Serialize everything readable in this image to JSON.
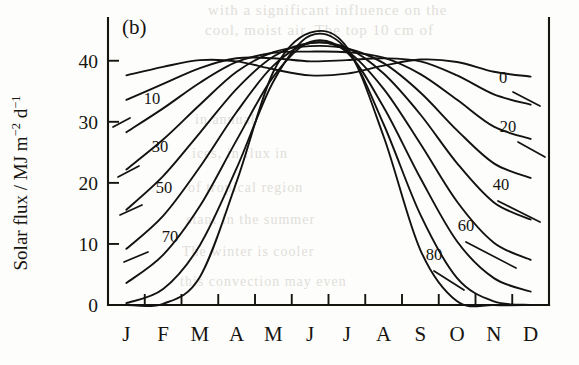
{
  "figure": {
    "panel_label": "(b)",
    "axis_title_y_parts": {
      "main": "Solar flux / MJ m",
      "sup1": "−2",
      "mid": " d",
      "sup2": "−1"
    },
    "y_axis_title_plain": "Solar flux / MJ m-2 d-1"
  },
  "bleed_text": {
    "line1": "with a significant influence on the",
    "line2": "cool, moist air. The top 10 cm of",
    "line3": "in annual",
    "line4": "ices, in flux in",
    "line5": "of tropical region",
    "line6": "stant in the summer",
    "line7": "The winter is cooler",
    "line8": "this convection may even"
  },
  "chart_data": {
    "type": "line",
    "title": "(b)",
    "xlabel": "",
    "ylabel": "Solar flux / MJ m-2 d-1",
    "xlim": [
      0,
      12
    ],
    "ylim": [
      0,
      47
    ],
    "grid": false,
    "legend_position": "inline-curve-labels",
    "yticks": [
      0,
      10,
      20,
      30,
      40
    ],
    "ytick_labels": [
      "0",
      "10",
      "20",
      "30",
      "40"
    ],
    "x": [
      0.5,
      1.5,
      2.5,
      3.5,
      4.5,
      5.5,
      6.5,
      7.5,
      8.5,
      9.5,
      10.5,
      11.5
    ],
    "xtick_labels": [
      "J",
      "F",
      "M",
      "A",
      "M",
      "J",
      "J",
      "A",
      "S",
      "O",
      "N",
      "D"
    ],
    "series": [
      {
        "name": "0",
        "label": "0",
        "label_side": "right",
        "values": [
          37.6,
          39.0,
          40.1,
          39.9,
          38.6,
          37.6,
          37.9,
          39.2,
          40.2,
          39.8,
          38.2,
          37.4
        ]
      },
      {
        "name": "10",
        "label": "10",
        "label_side": "left",
        "values": [
          33.6,
          36.2,
          38.8,
          40.4,
          40.4,
          39.9,
          40.1,
          40.4,
          39.9,
          37.6,
          34.5,
          32.8
        ]
      },
      {
        "name": "20",
        "label": "20",
        "label_side": "right",
        "values": [
          28.3,
          32.2,
          36.4,
          39.8,
          41.3,
          41.5,
          41.4,
          40.5,
          37.8,
          33.6,
          29.2,
          27.2
        ]
      },
      {
        "name": "30",
        "label": "30",
        "label_side": "left",
        "values": [
          22.2,
          27.1,
          32.8,
          38.2,
          41.4,
          42.4,
          42.0,
          39.6,
          34.8,
          28.6,
          23.2,
          20.8
        ]
      },
      {
        "name": "40",
        "label": "40",
        "label_side": "right",
        "values": [
          15.6,
          21.1,
          28.2,
          35.4,
          40.7,
          42.9,
          42.1,
          37.9,
          31.2,
          23.2,
          16.8,
          14.0
        ]
      },
      {
        "name": "50",
        "label": "50",
        "label_side": "left",
        "values": [
          9.2,
          14.6,
          22.6,
          31.6,
          39.2,
          42.9,
          41.6,
          35.4,
          26.4,
          16.9,
          10.2,
          7.4
        ]
      },
      {
        "name": "60",
        "label": "60",
        "label_side": "right",
        "values": [
          3.6,
          8.2,
          16.2,
          27.0,
          37.4,
          43.1,
          41.4,
          32.4,
          20.8,
          10.4,
          4.4,
          2.2
        ]
      },
      {
        "name": "70",
        "label": "70",
        "label_side": "left",
        "values": [
          0.3,
          2.6,
          9.8,
          22.4,
          36.6,
          44.1,
          41.8,
          29.6,
          14.8,
          4.4,
          0.6,
          0.0
        ]
      },
      {
        "name": "80",
        "label": "80",
        "label_side": "right",
        "values": [
          0.0,
          0.2,
          4.6,
          20.2,
          38.2,
          44.6,
          42.2,
          27.6,
          9.0,
          0.6,
          0.0,
          0.0
        ]
      }
    ]
  }
}
